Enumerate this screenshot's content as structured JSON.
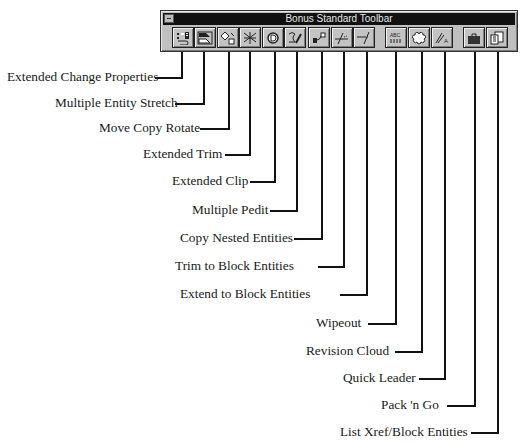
{
  "toolbar": {
    "title": "Bonus Standard Toolbar",
    "buttons": [
      {
        "label": "Extended Change Properties",
        "icon": "change-properties-icon"
      },
      {
        "label": "Multiple Entity Stretch",
        "icon": "stretch-icon"
      },
      {
        "label": "Move Copy Rotate",
        "icon": "move-copy-rotate-icon"
      },
      {
        "label": "Extended Trim",
        "icon": "extended-trim-icon"
      },
      {
        "label": "Extended Clip",
        "icon": "extended-clip-icon"
      },
      {
        "label": "Multiple Pedit",
        "icon": "multiple-pedit-icon"
      },
      {
        "label": "Copy Nested Entities",
        "icon": "copy-nested-icon"
      },
      {
        "label": "Trim to Block Entities",
        "icon": "trim-block-icon"
      },
      {
        "label": "Extend to Block Entities",
        "icon": "extend-block-icon"
      },
      {
        "label": "Wipeout",
        "icon": "wipeout-icon"
      },
      {
        "label": "Revision Cloud",
        "icon": "revision-cloud-icon"
      },
      {
        "label": "Quick Leader",
        "icon": "quick-leader-icon"
      },
      {
        "label": "Pack 'n Go",
        "icon": "briefcase-icon"
      },
      {
        "label": "List Xref/Block Entities",
        "icon": "list-xref-icon"
      }
    ]
  },
  "callouts": [
    {
      "label": "Extended Change Properties"
    },
    {
      "label": "Multiple Entity Stretch"
    },
    {
      "label": "Move Copy Rotate"
    },
    {
      "label": "Extended Trim"
    },
    {
      "label": "Extended Clip"
    },
    {
      "label": "Multiple Pedit"
    },
    {
      "label": "Copy Nested Entities"
    },
    {
      "label": "Trim to Block Entities"
    },
    {
      "label": "Extend to Block Entities"
    },
    {
      "label": "Wipeout"
    },
    {
      "label": "Revision Cloud"
    },
    {
      "label": "Quick Leader"
    },
    {
      "label": "Pack 'n Go"
    },
    {
      "label": "List Xref/Block Entities"
    }
  ]
}
